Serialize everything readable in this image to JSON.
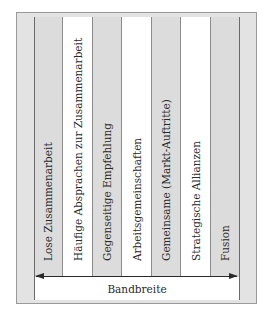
{
  "diagram": {
    "type": "spectrum",
    "orientation": "vertical-columns",
    "columns": [
      {
        "label": "Lose Zusammenarbeit",
        "shade": "gray"
      },
      {
        "label": "Häufige Absprachen zur Zusammenarbeit",
        "shade": "white"
      },
      {
        "label": "Gegenseitige Empfehlung",
        "shade": "gray"
      },
      {
        "label": "Arbeitsgemeinschaften",
        "shade": "white"
      },
      {
        "label": "Gemeinsame (Markt-Auftritte)",
        "shade": "gray"
      },
      {
        "label": "Strategische Allianzen",
        "shade": "white"
      },
      {
        "label": "Fusion",
        "shade": "gray"
      }
    ],
    "axis": {
      "label": "Bandbreite",
      "arrow": "bidirectional"
    },
    "colors": {
      "frame": "#e3e3e3",
      "gray_column": "#dcdcdc",
      "white_column": "#ffffff",
      "lines": "#2a2a2a"
    }
  }
}
